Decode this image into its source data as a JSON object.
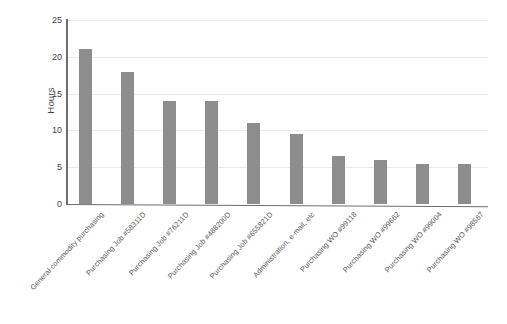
{
  "chart_data": {
    "type": "bar",
    "title": "",
    "xlabel": "",
    "ylabel": "Hours",
    "ylim": [
      0,
      25
    ],
    "yticks": [
      0,
      5,
      10,
      15,
      20,
      25
    ],
    "grid": true,
    "legend": "none",
    "orientation": "vertical",
    "bar_color": "#8d8d8d",
    "categories": [
      "General commodity purchasing",
      "Purchasing Job #58311D",
      "Purchasing Job #76211D",
      "Purchasing Job #488200D",
      "Purchasing Job #655821D",
      "Administration, e-mail, etc",
      "Purchasing WO #99118",
      "Purchasing WO #99662",
      "Purchasing WO #99004",
      "Purchasing WO #98567"
    ],
    "values": [
      21,
      18,
      14,
      14,
      11,
      9.5,
      6.5,
      6,
      5.5,
      5.5
    ]
  },
  "axis": {
    "y_title": "Hours",
    "y_tick_labels": [
      "25",
      "20",
      "15",
      "10",
      "5",
      "0"
    ]
  }
}
